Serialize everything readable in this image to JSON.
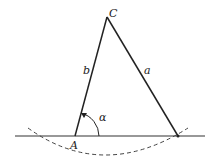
{
  "diagram": {
    "type": "geometry-triangle-construction",
    "vertices": {
      "A": {
        "label": "A",
        "x": 75,
        "y": 136
      },
      "B": {
        "label": "",
        "x": 178,
        "y": 136
      },
      "C": {
        "label": "C",
        "x": 107,
        "y": 17
      }
    },
    "sides": {
      "b": {
        "label": "b",
        "from": "A",
        "to": "C"
      },
      "a": {
        "label": "a",
        "from": "C",
        "to": "B"
      }
    },
    "angle": {
      "label": "α",
      "vertex": "A"
    },
    "baseline": {
      "x1": 15,
      "x2": 205,
      "y": 136
    },
    "arc": {
      "style": "dashed",
      "center_vertex": "C"
    },
    "colors": {
      "stroke": "#222222",
      "background": "#ffffff"
    }
  }
}
